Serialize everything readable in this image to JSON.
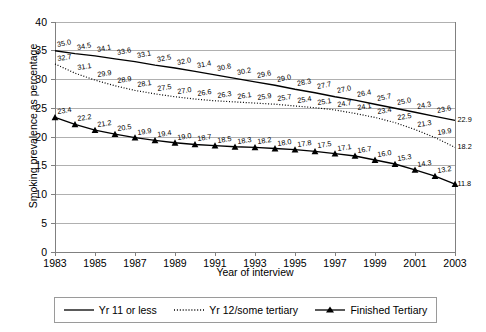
{
  "chart_data": {
    "type": "line",
    "title": "",
    "xlabel": "Year of interview",
    "ylabel": "Smoking prevalence as percentage",
    "x": [
      1983,
      1984,
      1985,
      1986,
      1987,
      1988,
      1989,
      1990,
      1991,
      1992,
      1993,
      1994,
      1995,
      1996,
      1997,
      1998,
      1999,
      2000,
      2001,
      2002,
      2003
    ],
    "xlim": [
      1983,
      2003
    ],
    "ylim": [
      0,
      40
    ],
    "yticks": [
      0,
      5,
      10,
      15,
      20,
      25,
      30,
      35,
      40
    ],
    "xticks": [
      1983,
      1985,
      1987,
      1989,
      1991,
      1993,
      1995,
      1997,
      1999,
      2001,
      2003
    ],
    "xtick_labels": [
      "1983",
      "1985",
      "1987",
      "1989",
      "1991",
      "1993",
      "1995",
      "1997",
      "1999",
      "2001",
      "2003"
    ],
    "ytick_labels": [
      "0",
      "5",
      "10",
      "15",
      "20",
      "25",
      "30",
      "35",
      "40"
    ],
    "grid": "horizontal",
    "legend_position": "bottom",
    "series": [
      {
        "name": "Yr 11 or less",
        "style": "solid",
        "marker": "none",
        "color": "#000000",
        "values": [
          35.0,
          34.5,
          34.1,
          33.6,
          33.1,
          32.5,
          32.0,
          31.4,
          30.8,
          30.2,
          29.6,
          29.0,
          28.3,
          27.7,
          27.0,
          26.4,
          25.7,
          25.0,
          24.3,
          23.6,
          22.9
        ],
        "labels": [
          "35.0",
          "34.5",
          "34.1",
          "33.6",
          "33.1",
          "32.5",
          "32.0",
          "31.4",
          "30.8",
          "30.2",
          "29.6",
          "29.0",
          "28.3",
          "27.7",
          "27.0",
          "26.4",
          "25.7",
          "25.0",
          "24.3",
          "23.6",
          "22.9"
        ]
      },
      {
        "name": "Yr 12/some tertiary",
        "style": "dotted",
        "marker": "none",
        "color": "#000000",
        "values": [
          32.7,
          31.1,
          29.9,
          28.9,
          28.1,
          27.5,
          27.0,
          26.6,
          26.3,
          26.1,
          25.9,
          25.7,
          25.4,
          25.1,
          24.7,
          24.1,
          23.4,
          22.5,
          21.3,
          19.9,
          18.2
        ],
        "labels": [
          "32.7",
          "31.1",
          "29.9",
          "28.9",
          "28.1",
          "27.5",
          "27.0",
          "26.6",
          "26.3",
          "26.1",
          "25.9",
          "25.7",
          "25.4",
          "25.1",
          "24.7",
          "24.1",
          "23.4",
          "22.5",
          "21.3",
          "19.9",
          "18.2"
        ]
      },
      {
        "name": "Finished Tertiary",
        "style": "solid",
        "marker": "triangle",
        "color": "#000000",
        "values": [
          23.4,
          22.2,
          21.2,
          20.5,
          19.9,
          19.4,
          19.0,
          18.7,
          18.5,
          18.3,
          18.2,
          18.0,
          17.8,
          17.5,
          17.1,
          16.7,
          16.0,
          15.3,
          14.3,
          13.2,
          11.8
        ],
        "labels": [
          "23.4",
          "22.2",
          "21.2",
          "20.5",
          "19.9",
          "19.4",
          "19.0",
          "18.7",
          "18.5",
          "18.3",
          "18.2",
          "18.0",
          "17.8",
          "17.5",
          "17.1",
          "16.7",
          "16.0",
          "15.3",
          "14.3",
          "13.2",
          "11.8"
        ]
      }
    ]
  },
  "legend": {
    "items": [
      {
        "label": "Yr 11 or less",
        "swatch": "solid-line-swatch"
      },
      {
        "label": "Yr 12/some tertiary",
        "swatch": "dotted-line-swatch"
      },
      {
        "label": "Finished Tertiary",
        "swatch": "triangle-line-swatch"
      }
    ]
  },
  "axes": {
    "x_title": "Year of interview",
    "y_title": "Smoking prevalence as percentage"
  },
  "colors": {
    "line": "#000000",
    "grid": "#b0b0b0",
    "axis": "#808080",
    "background": "#ffffff"
  }
}
